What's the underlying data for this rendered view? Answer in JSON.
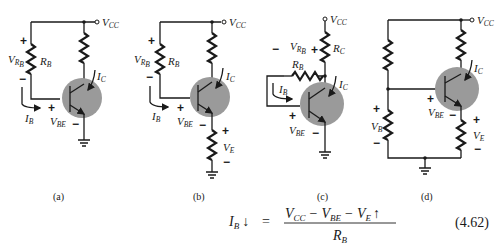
{
  "figure": {
    "circuits": [
      {
        "id": "a",
        "caption": "(a)",
        "labels": {
          "vcc": "V",
          "vcc_sub": "CC",
          "vrb": "V",
          "vrb_sub": "R",
          "vrb_subsub": "B",
          "rb": "R",
          "rb_sub": "B",
          "ic": "I",
          "ic_sub": "C",
          "ib": "I",
          "ib_sub": "B",
          "vbe": "V",
          "vbe_sub": "BE",
          "plus": "+",
          "minus": "−"
        }
      },
      {
        "id": "b",
        "caption": "(b)",
        "labels": {
          "vcc": "V",
          "vcc_sub": "CC",
          "vrb": "V",
          "vrb_sub": "R",
          "vrb_subsub": "B",
          "rb": "R",
          "rb_sub": "B",
          "ic": "I",
          "ic_sub": "C",
          "ib": "I",
          "ib_sub": "B",
          "vbe": "V",
          "vbe_sub": "BE",
          "ve": "V",
          "ve_sub": "E",
          "plus": "+",
          "minus": "−"
        }
      },
      {
        "id": "c",
        "caption": "(c)",
        "labels": {
          "vcc": "V",
          "vcc_sub": "CC",
          "vrb": "V",
          "vrb_sub": "R",
          "vrb_subsub": "B",
          "rb": "R",
          "rb_sub": "B",
          "rc": "R",
          "rc_sub": "C",
          "ic": "I",
          "ic_sub": "C",
          "ib": "I",
          "ib_sub": "B",
          "vbe": "V",
          "vbe_sub": "BE",
          "plus": "+",
          "minus": "−"
        }
      },
      {
        "id": "d",
        "caption": "(d)",
        "labels": {
          "vcc": "V",
          "vcc_sub": "CC",
          "ic": "I",
          "ic_sub": "C",
          "vbe": "V",
          "vbe_sub": "BE",
          "vb": "V",
          "vb_sub": "B",
          "ve": "V",
          "ve_sub": "E",
          "plus": "+",
          "minus": "−"
        }
      }
    ],
    "equation": {
      "lhs": "I",
      "lhs_sub": "B",
      "lhs_arrow": "↓",
      "equals": "=",
      "numerator": {
        "t1": "V",
        "t1_sub": "CC",
        "op1": "−",
        "t2": "V",
        "t2_sub": "BE",
        "op2": "−",
        "t3": "V",
        "t3_sub": "E",
        "t3_arrow": "↑"
      },
      "denominator": {
        "t": "R",
        "t_sub": "B"
      },
      "number": "(4.62)"
    }
  }
}
